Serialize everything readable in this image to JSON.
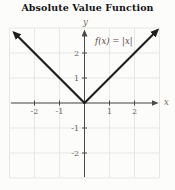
{
  "title": "Absolute Value Function",
  "function_label": "f(x) = |x|",
  "axes": {
    "x_label": "x",
    "y_label": "y"
  },
  "colors": {
    "bg": "#fcfcfa",
    "title": "#151515",
    "grid": "#e7e7e4",
    "axis": "#4a4a48",
    "tick": "#6a625c",
    "axisletter": "#7a6a60",
    "fn": "#5f463f",
    "line": "#1e1e1e"
  },
  "chart_data": {
    "type": "line",
    "title": "Absolute Value Function",
    "function": "f(x) = |x|",
    "xlabel": "x",
    "ylabel": "y",
    "xlim": [
      -3,
      3
    ],
    "ylim": [
      -3,
      3
    ],
    "grid": true,
    "unit_px": 25,
    "x_ticks": [
      -2,
      -1,
      1,
      2
    ],
    "x_tick_labels": [
      "-2",
      "-1",
      "1",
      "2"
    ],
    "y_ticks": [
      -2,
      -1,
      1,
      2
    ],
    "y_tick_labels": [
      "-2",
      "-1",
      "1",
      "2"
    ],
    "series": [
      {
        "name": "f(x) = |x|",
        "x": [
          -3,
          -2,
          -1,
          0,
          1,
          2,
          3
        ],
        "y": [
          3,
          2,
          1,
          0,
          1,
          2,
          3
        ]
      }
    ],
    "rays": [
      {
        "from": [
          0,
          0
        ],
        "to": [
          -2.8,
          2.8
        ]
      },
      {
        "from": [
          0,
          0
        ],
        "to": [
          2.9,
          2.9
        ]
      }
    ]
  }
}
